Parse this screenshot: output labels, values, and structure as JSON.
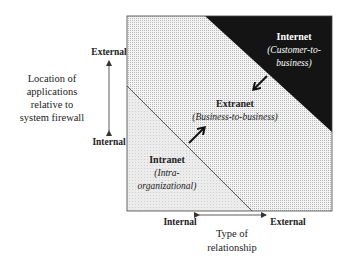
{
  "diagram": {
    "type": "quadrant-zones",
    "zones": [
      {
        "id": "internet",
        "title": "Internet",
        "subtitle_line1": "(Customer-to-",
        "subtitle_line2": "business)",
        "fill": "#141414",
        "text_color": "#ffffff"
      },
      {
        "id": "extranet",
        "title": "Extranet",
        "subtitle_line1": "(Business-to-business)",
        "fill": "#d9d9d9",
        "text_color": "#222222"
      },
      {
        "id": "intranet",
        "title": "Intranet",
        "subtitle_line1": "(Intra-",
        "subtitle_line2": "organizational)",
        "fill": "#e6e6e6",
        "text_color": "#222222"
      }
    ],
    "y_axis": {
      "top_label": "External",
      "bottom_label": "Internal",
      "title_lines": [
        "Location of",
        "applications",
        "relative to",
        "system firewall"
      ]
    },
    "x_axis": {
      "left_label": "Internal",
      "right_label": "External",
      "title_lines": [
        "Type of",
        "relationship"
      ]
    },
    "arrows": [
      {
        "from": "internet",
        "to": "extranet",
        "direction": "down-left"
      },
      {
        "from": "intranet",
        "to": "extranet",
        "direction": "up-right"
      }
    ]
  }
}
